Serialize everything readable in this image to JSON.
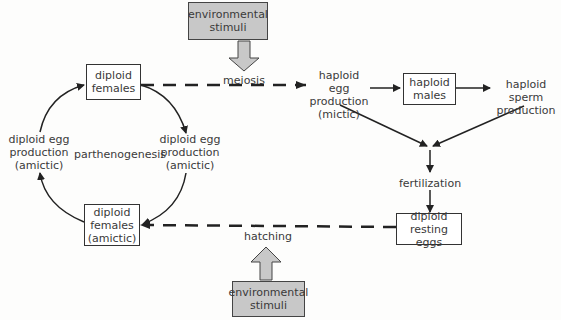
{
  "diagram": {
    "nodes": {
      "env_top": "environmental\nstimuli",
      "env_bottom": "environmental\nstimuli",
      "diploid_females": "diploid\nfemales",
      "diploid_females_amictic": "diploid\nfemales\n(amictic)",
      "haploid_males": "haploid\nmales",
      "resting_eggs": "diploid\nresting eggs"
    },
    "labels": {
      "meiosis": "meiosis",
      "hatching": "hatching",
      "fertilization": "fertilization",
      "parthenogenesis": "parthenogenesis",
      "haploid_egg": "haploid egg\nproduction\n(mictic)",
      "haploid_sperm": "haploid sperm\nproduction",
      "diploid_egg_left": "diploid egg\nproduction\n(amictic)",
      "diploid_egg_right": "diploid egg\nproduction\n(amictic)"
    },
    "colors": {
      "env_fill": "#c8c8c8",
      "line": "#222222",
      "text": "#3a3a3a"
    }
  }
}
